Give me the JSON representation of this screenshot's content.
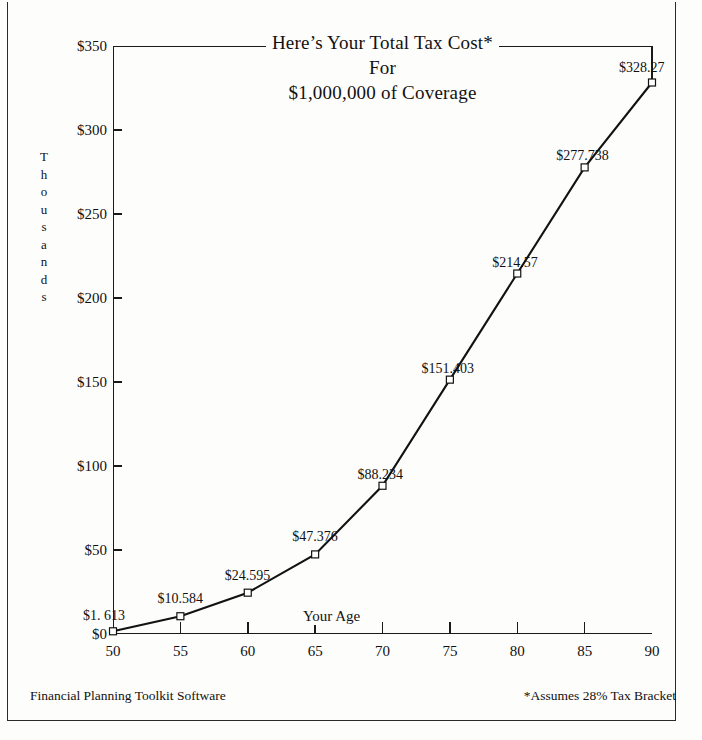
{
  "document": {
    "title_lines": [
      "Here’s Your Total Tax Cost*",
      "For",
      "$1,000,000 of Coverage"
    ],
    "footer_left": "Financial Planning Toolkit Software",
    "footer_right": "*Assumes 28% Tax Bracket"
  },
  "axis": {
    "y_title_letters": [
      "T",
      "h",
      "o",
      "u",
      "s",
      "a",
      "n",
      "d",
      "s"
    ],
    "y_title": "Thousands",
    "x_title": "Your Age"
  },
  "chart_data": {
    "type": "line",
    "title": "Here’s Your Total Tax Cost* For $1,000,000 of Coverage",
    "xlabel": "Your Age",
    "ylabel": "Thousands",
    "xlim": [
      50,
      90
    ],
    "ylim": [
      0,
      350
    ],
    "grid": false,
    "legend": null,
    "x_ticks": [
      50,
      55,
      60,
      65,
      70,
      75,
      80,
      85,
      90
    ],
    "x_tick_labels": [
      "50",
      "55",
      "60",
      "65",
      "70",
      "75",
      "80",
      "85",
      "90"
    ],
    "y_ticks": [
      0,
      50,
      100,
      150,
      200,
      250,
      300,
      350
    ],
    "y_tick_labels": [
      "$0",
      "$50",
      "$100",
      "$150",
      "$200",
      "$250",
      "$300",
      "$350"
    ],
    "marker": "open-square",
    "series": [
      {
        "name": "Total Tax Cost",
        "x": [
          50,
          55,
          60,
          65,
          70,
          75,
          80,
          85,
          90
        ],
        "values": [
          1.613,
          10.584,
          24.595,
          47.376,
          88.234,
          151.403,
          214.57,
          277.738,
          328.27
        ],
        "point_labels": [
          "$1. 613",
          "$10.584",
          "$24.595",
          "$47.376",
          "$88.234",
          "$151.403",
          "$214.57",
          "$277.738",
          "$328.27"
        ]
      }
    ]
  }
}
